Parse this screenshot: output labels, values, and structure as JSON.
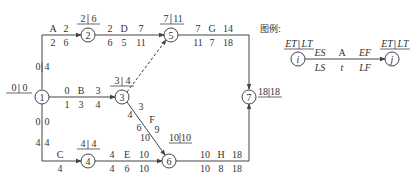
{
  "diagram": {
    "type": "activity-on-arrow network (double-code network)",
    "nodes": [
      {
        "id": "1",
        "label": "1",
        "ET": "0",
        "LT": "0"
      },
      {
        "id": "2",
        "label": "2",
        "ET": "2",
        "LT": "6"
      },
      {
        "id": "3",
        "label": "3",
        "ET": "3",
        "LT": "4"
      },
      {
        "id": "4",
        "label": "4",
        "ET": "4",
        "LT": "4"
      },
      {
        "id": "5",
        "label": "5",
        "ET": "7",
        "LT": "11"
      },
      {
        "id": "6",
        "label": "6",
        "ET": "10",
        "LT": "10"
      },
      {
        "id": "7",
        "label": "7",
        "ET": "18",
        "LT": "18"
      }
    ],
    "activities": [
      {
        "name": "A",
        "from": "1",
        "to": "2",
        "duration": "6",
        "ES": "2",
        "LS": "",
        "EF": "2",
        "LF": "6",
        "top": [
          "A",
          "2"
        ],
        "bottom": [
          "2",
          "6"
        ],
        "vertical": [
          "0",
          "4"
        ]
      },
      {
        "name": "B",
        "from": "1",
        "to": "3",
        "ES": "0",
        "EF": "3",
        "LS": "1",
        "LF": "4",
        "duration": "3",
        "top": [
          "0",
          "B",
          "3"
        ],
        "bottom": [
          "1",
          "3",
          "4"
        ]
      },
      {
        "name": "C",
        "from": "1",
        "to": "4",
        "duration": "4",
        "top": [
          "C"
        ],
        "bottom": [
          "4"
        ],
        "vertical_top": [
          "0",
          "0"
        ],
        "vertical_bottom": [
          "4",
          "4"
        ]
      },
      {
        "name": "D",
        "from": "2",
        "to": "5",
        "ES": "2",
        "EF": "7",
        "LS": "6",
        "LF": "11",
        "duration": "5",
        "top": [
          "2",
          "D",
          "7"
        ],
        "bottom": [
          "6",
          "5",
          "11"
        ]
      },
      {
        "name": "E",
        "from": "4",
        "to": "6",
        "ES": "4",
        "EF": "10",
        "LS": "4",
        "LF": "10",
        "duration": "6",
        "top": [
          "4",
          "E",
          "10"
        ],
        "bottom": [
          "4",
          "6",
          "10"
        ]
      },
      {
        "name": "F",
        "from": "3",
        "to": "6",
        "ES": "3",
        "EF": "9",
        "LS": "4",
        "LF": "10",
        "duration": "6",
        "labels": [
          "3",
          "4",
          "F",
          "6",
          "9",
          "10"
        ]
      },
      {
        "name": "G",
        "from": "5",
        "to": "7",
        "ES": "7",
        "EF": "14",
        "LS": "11",
        "LF": "18",
        "duration": "7",
        "top": [
          "7",
          "G",
          "14"
        ],
        "bottom": [
          "11",
          "7",
          "18"
        ]
      },
      {
        "name": "H",
        "from": "6",
        "to": "7",
        "ES": "10",
        "EF": "18",
        "LS": "10",
        "LF": "18",
        "duration": "8",
        "top": [
          "10",
          "H",
          "18"
        ],
        "bottom": [
          "10",
          "8",
          "18"
        ]
      },
      {
        "name": "dummy",
        "from": "3",
        "to": "5",
        "style": "dashed"
      }
    ],
    "labels": {
      "n1_et": "0",
      "n1_lt": "0",
      "n2_et": "2",
      "n2_lt": "6",
      "n3_et": "3",
      "n3_lt": "4",
      "n4_et": "4",
      "n4_lt": "4",
      "n5_et": "7",
      "n5_lt": "11",
      "n6_et": "10",
      "n6_lt": "10",
      "n7_et": "18",
      "n7_lt": "18",
      "A_name": "A",
      "A_t1": "2",
      "A_b1": "2",
      "A_b2": "6",
      "A_v1": "0",
      "A_v2": "4",
      "B_t1": "0",
      "B_name": "B",
      "B_t2": "3",
      "B_b1": "1",
      "B_b2": "3",
      "B_b3": "4",
      "C_v1": "0",
      "C_v2": "0",
      "C_v3": "4",
      "C_v4": "4",
      "C_name": "C",
      "C_b1": "4",
      "D_t1": "2",
      "D_name": "D",
      "D_t2": "7",
      "D_b1": "6",
      "D_b2": "5",
      "D_b3": "11",
      "E_t1": "4",
      "E_name": "E",
      "E_t2": "10",
      "E_b1": "4",
      "E_b2": "6",
      "E_b3": "10",
      "F_1": "3",
      "F_2": "4",
      "F_name": "F",
      "F_3": "6",
      "F_4": "9",
      "F_5": "10",
      "G_t1": "7",
      "G_name": "G",
      "G_t2": "14",
      "G_b1": "11",
      "G_b2": "7",
      "G_b3": "18",
      "H_t1": "10",
      "H_name": "H",
      "H_t2": "18",
      "H_b1": "10",
      "H_b2": "8",
      "H_b3": "18"
    }
  },
  "legend": {
    "title": "图例:",
    "node_i": "i",
    "node_j": "j",
    "i_et": "ET",
    "i_lt": "LT",
    "j_et": "ET",
    "j_lt": "LT",
    "es": "ES",
    "name": "A",
    "ef": "EF",
    "ls": "LS",
    "t": "t",
    "lf": "LF"
  },
  "colors": {
    "line": "#444444",
    "text": "#333333",
    "background": "#ffffff"
  }
}
